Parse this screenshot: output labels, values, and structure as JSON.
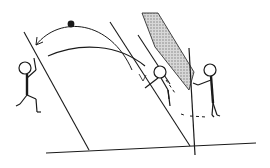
{
  "diagram": {
    "title": "",
    "type": "line-art illustration",
    "colors": {
      "ink": "#1a1a1a",
      "shade": "#9a9a9a",
      "background": "#ffffff"
    },
    "elements": [
      {
        "id": "ball",
        "label": "ball"
      },
      {
        "id": "throw-arc",
        "label": "arrow arc from ball to left player"
      },
      {
        "id": "second-arc",
        "label": "lower curved trajectory"
      },
      {
        "id": "left-player",
        "label": "stick figure leaning against left line"
      },
      {
        "id": "middle-player",
        "label": "stick figure between slanted lines"
      },
      {
        "id": "right-player",
        "label": "stick figure holding vertical pole"
      },
      {
        "id": "shaded-band",
        "label": "dotted shaded diagonal band"
      },
      {
        "id": "dashed-path",
        "label": "dashed movement path"
      },
      {
        "id": "ground-line",
        "label": "ground line"
      }
    ]
  }
}
